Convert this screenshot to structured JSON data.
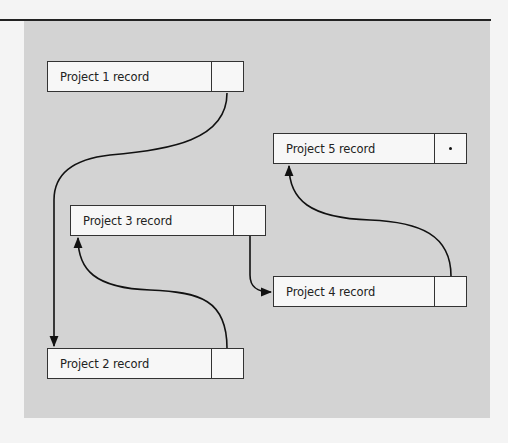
{
  "diagram": {
    "type": "linked-list",
    "records": [
      {
        "id": "p1",
        "label": "Project 1 record",
        "next": "p2"
      },
      {
        "id": "p2",
        "label": "Project 2 record",
        "next": "p3"
      },
      {
        "id": "p3",
        "label": "Project 3 record",
        "next": "p4"
      },
      {
        "id": "p4",
        "label": "Project 4 record",
        "next": "p5"
      },
      {
        "id": "p5",
        "label": "Project 5 record",
        "next": null,
        "null_marker": "•"
      }
    ],
    "colors": {
      "panel": "#d3d3d3",
      "record_fill": "#f7f7f7",
      "stroke": "#222222"
    }
  }
}
